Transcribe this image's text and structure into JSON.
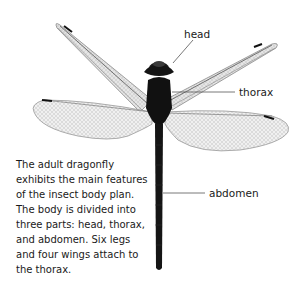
{
  "figure": {
    "labels": {
      "head": "head",
      "thorax": "thorax",
      "abdomen": "abdomen"
    },
    "caption_lines": [
      "The adult dragonfly",
      "exhibits the main features",
      "of the insect body plan.",
      "The body is divided into",
      "three parts: head, thorax,",
      "and abdomen. Six legs",
      "and four wings attach to",
      "the thorax."
    ],
    "colors": {
      "background": "#ffffff",
      "body": "#141414",
      "wing_fill": "#f2f2f2",
      "wing_vein": "#8a8a8a",
      "leader_line": "#555555",
      "text": "#1a1a1a"
    }
  }
}
